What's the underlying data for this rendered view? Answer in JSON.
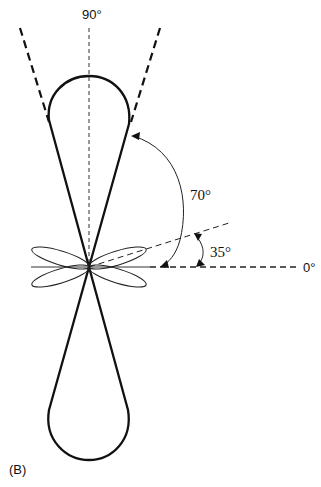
{
  "figure": {
    "panel_label": "(B)",
    "axis_labels": {
      "vertical": "90°",
      "horizontal": "0°"
    },
    "angle_annotations": [
      {
        "label": "70°",
        "description": "angle from 0° axis to main lobe edge"
      },
      {
        "label": "35°",
        "description": "angle from 0° axis to minor lobe axis"
      }
    ],
    "colors": {
      "stroke": "#111111",
      "background": "#ffffff"
    }
  }
}
